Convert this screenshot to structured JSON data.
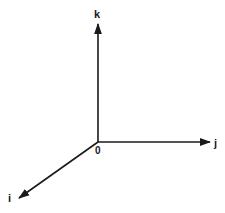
{
  "diagram": {
    "type": "3d-coordinate-axes",
    "origin_label": "0",
    "axes": [
      {
        "name": "k",
        "label": "k",
        "direction": "up"
      },
      {
        "name": "j",
        "label": "j",
        "direction": "right"
      },
      {
        "name": "i",
        "label": "i",
        "direction": "down-left"
      }
    ],
    "colors": {
      "stroke": "#1a1a1a",
      "background": "#ffffff"
    }
  }
}
